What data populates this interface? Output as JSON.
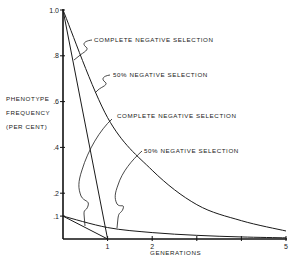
{
  "chart_data": {
    "type": "line",
    "title": "",
    "xlabel": "GENERATIONS",
    "ylabel": [
      "PHENOTYPE",
      "FREQUENCY",
      "(PER CENT)"
    ],
    "xlim": [
      0,
      5
    ],
    "ylim": [
      0,
      1.0
    ],
    "x_ticks": [
      1,
      2,
      3,
      4,
      5
    ],
    "x_tick_labels": [
      "1",
      "2",
      "",
      "",
      "5"
    ],
    "y_ticks": [
      0.1,
      0.2,
      0.4,
      0.6,
      0.8,
      1.0
    ],
    "y_tick_labels": [
      ".1",
      ".2",
      ".4",
      ".6",
      ".8",
      "1.0"
    ],
    "grid": false,
    "series": [
      {
        "name": "Complete negative selection (from 1.0)",
        "x": [
          0,
          1
        ],
        "y": [
          1.0,
          0.0
        ]
      },
      {
        "name": "50% negative selection (from 1.0)",
        "x": [
          0,
          1,
          2,
          3,
          4,
          5
        ],
        "y": [
          1.0,
          0.53,
          0.3,
          0.15,
          0.08,
          0.035
        ]
      },
      {
        "name": "Complete negative selection (from 0.1)",
        "x": [
          0,
          1
        ],
        "y": [
          0.1,
          0.0
        ]
      },
      {
        "name": "50% negative selection (from 0.1)",
        "x": [
          0,
          1,
          2,
          3,
          4,
          5
        ],
        "y": [
          0.1,
          0.05,
          0.028,
          0.016,
          0.009,
          0.005
        ]
      }
    ],
    "annotations": [
      {
        "text": "COMPLETE NEGATIVE SELECTION",
        "points_to": 0
      },
      {
        "text": "50% NEGATIVE SELECTION",
        "points_to": 1
      },
      {
        "text": "COMPLETE NEGATIVE SELECTION",
        "points_to": 2
      },
      {
        "text": "50% NEGATIVE SELECTION",
        "points_to": 3
      }
    ]
  }
}
